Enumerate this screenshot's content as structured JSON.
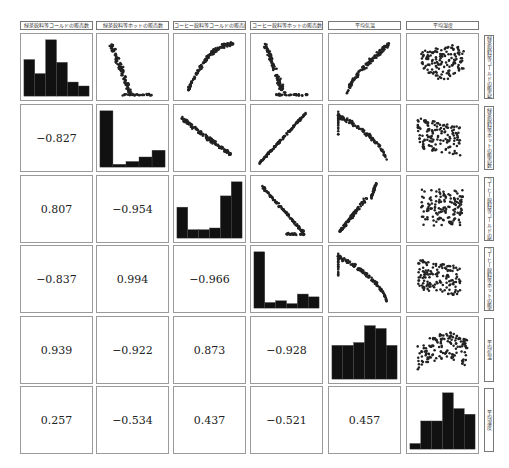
{
  "chart_data": {
    "type": "scatter",
    "title": "",
    "variables": [
      "緑茶飲料等コールドの販売数",
      "緑茶飲料等ホットの販売数",
      "コーヒー飲料等コールドの販売数",
      "コーヒー飲料等ホットの販売数",
      "平均気温",
      "平均湿度"
    ],
    "column_headers": [
      "緑茶飲料等コールドの販売数",
      "緑茶飲料等ホットの販売数",
      "コーヒー飲料等コールドの販売数",
      "コーヒー飲料等ホットの販売数",
      "平均気温",
      "平均湿度"
    ],
    "row_labels": [
      "緑茶飲料等コールドの販売数",
      "緑茶飲料等ホットの販売数",
      "コーヒー飲料等コールドの販売数",
      "コーヒー飲料等ホットの販売数",
      "平均気温",
      "平均湿度"
    ],
    "correlations": [
      {
        "row": 1,
        "col": 0,
        "label": "−0.827",
        "value": -0.827
      },
      {
        "row": 2,
        "col": 0,
        "label": "0.807",
        "value": 0.807
      },
      {
        "row": 2,
        "col": 1,
        "label": "−0.954",
        "value": -0.954
      },
      {
        "row": 3,
        "col": 0,
        "label": "−0.837",
        "value": -0.837
      },
      {
        "row": 3,
        "col": 1,
        "label": "0.994",
        "value": 0.994
      },
      {
        "row": 3,
        "col": 2,
        "label": "−0.966",
        "value": -0.966
      },
      {
        "row": 4,
        "col": 0,
        "label": "0.939",
        "value": 0.939
      },
      {
        "row": 4,
        "col": 1,
        "label": "−0.922",
        "value": -0.922
      },
      {
        "row": 4,
        "col": 2,
        "label": "0.873",
        "value": 0.873
      },
      {
        "row": 4,
        "col": 3,
        "label": "−0.928",
        "value": -0.928
      },
      {
        "row": 5,
        "col": 0,
        "label": "0.257",
        "value": 0.257
      },
      {
        "row": 5,
        "col": 1,
        "label": "−0.534",
        "value": -0.534
      },
      {
        "row": 5,
        "col": 2,
        "label": "0.437",
        "value": 0.437
      },
      {
        "row": 5,
        "col": 3,
        "label": "−0.521",
        "value": -0.521
      },
      {
        "row": 5,
        "col": 4,
        "label": "0.457",
        "value": 0.457
      }
    ],
    "histograms": [
      {
        "variable": 0,
        "relative_counts": [
          0.65,
          0.4,
          1.0,
          0.6,
          0.25,
          0.18
        ]
      },
      {
        "variable": 1,
        "relative_counts": [
          1.0,
          0.05,
          0.1,
          0.18,
          0.3
        ]
      },
      {
        "variable": 2,
        "relative_counts": [
          0.55,
          0.15,
          0.15,
          0.18,
          0.75,
          1.0
        ]
      },
      {
        "variable": 3,
        "relative_counts": [
          1.0,
          0.1,
          0.13,
          0.08,
          0.25,
          0.2
        ]
      },
      {
        "variable": 4,
        "relative_counts": [
          0.6,
          0.6,
          0.65,
          0.95,
          0.9,
          0.6
        ]
      },
      {
        "variable": 5,
        "relative_counts": [
          0.1,
          0.5,
          0.5,
          1.0,
          0.72,
          0.62
        ]
      }
    ],
    "scatter_shapes": [
      {
        "row": 0,
        "col": 1,
        "pattern": "steep-negative-floor"
      },
      {
        "row": 0,
        "col": 2,
        "pattern": "rising-saturating"
      },
      {
        "row": 0,
        "col": 3,
        "pattern": "steep-negative-floor"
      },
      {
        "row": 0,
        "col": 4,
        "pattern": "positive-curved"
      },
      {
        "row": 0,
        "col": 5,
        "pattern": "blob-upper"
      },
      {
        "row": 1,
        "col": 2,
        "pattern": "negative-linear"
      },
      {
        "row": 1,
        "col": 3,
        "pattern": "positive-linear"
      },
      {
        "row": 1,
        "col": 4,
        "pattern": "negative-convex"
      },
      {
        "row": 1,
        "col": 5,
        "pattern": "blob-spread"
      },
      {
        "row": 2,
        "col": 3,
        "pattern": "negative-linear-floor"
      },
      {
        "row": 2,
        "col": 4,
        "pattern": "positive-hook"
      },
      {
        "row": 2,
        "col": 5,
        "pattern": "blob-wide"
      },
      {
        "row": 3,
        "col": 4,
        "pattern": "negative-convex"
      },
      {
        "row": 3,
        "col": 5,
        "pattern": "blob-spread"
      },
      {
        "row": 4,
        "col": 5,
        "pattern": "blob-arched"
      }
    ]
  },
  "caption": ""
}
